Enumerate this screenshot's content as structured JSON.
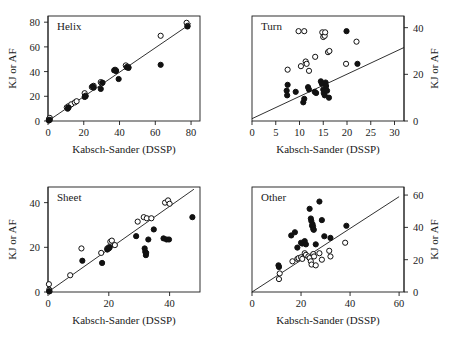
{
  "figure": {
    "background": "#ffffff",
    "marker_colors": {
      "open_circle_fill": "#ffffff",
      "open_circle_stroke": "#111111",
      "filled_circle": "#111111",
      "axis": "#1a1a1a",
      "fit_line": "#1a1a1a"
    }
  },
  "chart_data": [
    {
      "type": "scatter",
      "title": "Helix",
      "panel_index": 0,
      "xlabel": "Kabsch-Sander (DSSP)",
      "ylabel": "KJ or AF",
      "ylabel_side": "left",
      "xlim": [
        0,
        85
      ],
      "ylim": [
        0,
        85
      ],
      "xticks": [
        0,
        20,
        40,
        60,
        80
      ],
      "yticks": [
        0,
        20,
        40,
        60,
        80
      ],
      "grid": false,
      "legend": "none",
      "fit_line": {
        "x0": 0,
        "y0": 0,
        "x1": 80,
        "y1": 79
      },
      "series": [
        {
          "name": "open",
          "marker": "open-circle",
          "points": [
            [
              0.5,
              1.5
            ],
            [
              0.5,
              0.5
            ],
            [
              1.0,
              2.5
            ],
            [
              10.5,
              11.0
            ],
            [
              11.5,
              12.0
            ],
            [
              13.0,
              13.5
            ],
            [
              15.0,
              15.0
            ],
            [
              16.0,
              16.0
            ],
            [
              20.5,
              22.5
            ],
            [
              21.0,
              20.5
            ],
            [
              24.5,
              27.5
            ],
            [
              25.5,
              28.5
            ],
            [
              29.5,
              31.5
            ],
            [
              30.0,
              30.5
            ],
            [
              37.5,
              41.5
            ],
            [
              38.0,
              41.0
            ],
            [
              43.5,
              45.0
            ],
            [
              44.5,
              44.0
            ],
            [
              45.0,
              43.5
            ],
            [
              63.0,
              69.0
            ],
            [
              77.5,
              79.5
            ],
            [
              78.0,
              77.0
            ]
          ]
        },
        {
          "name": "filled",
          "marker": "filled-circle",
          "points": [
            [
              0.5,
              0.5
            ],
            [
              1.0,
              1.0
            ],
            [
              11.0,
              10.0
            ],
            [
              11.5,
              11.0
            ],
            [
              20.5,
              19.5
            ],
            [
              21.0,
              20.0
            ],
            [
              25.0,
              28.0
            ],
            [
              25.5,
              27.0
            ],
            [
              29.5,
              26.0
            ],
            [
              30.5,
              31.0
            ],
            [
              37.0,
              41.0
            ],
            [
              38.0,
              40.5
            ],
            [
              39.5,
              34.0
            ],
            [
              44.0,
              43.5
            ],
            [
              45.0,
              43.0
            ],
            [
              63.0,
              45.5
            ],
            [
              78.0,
              76.5
            ]
          ]
        }
      ]
    },
    {
      "type": "scatter",
      "title": "Turn",
      "panel_index": 1,
      "xlabel": "Kabsch-Sander (DSSP)",
      "ylabel": "KJ or AF",
      "ylabel_side": "right",
      "xlim": [
        0,
        32
      ],
      "ylim": [
        0,
        45
      ],
      "xticks": [
        0,
        5,
        10,
        15,
        20,
        25,
        30
      ],
      "yticks": [
        0,
        20,
        40
      ],
      "grid": false,
      "legend": "none",
      "fit_line": {
        "x0": 0,
        "y0": 1.0,
        "x1": 32,
        "y1": 31.5
      },
      "series": [
        {
          "name": "open",
          "marker": "open-circle",
          "points": [
            [
              7.5,
              22.0
            ],
            [
              9.8,
              38.5
            ],
            [
              10.3,
              23.5
            ],
            [
              11.0,
              38.5
            ],
            [
              11.3,
              25.5
            ],
            [
              11.5,
              24.5
            ],
            [
              12.0,
              21.5
            ],
            [
              13.3,
              27.5
            ],
            [
              14.8,
              38.0
            ],
            [
              15.0,
              36.0
            ],
            [
              15.3,
              36.5
            ],
            [
              15.4,
              38.0
            ],
            [
              16.0,
              29.5
            ],
            [
              16.3,
              30.0
            ],
            [
              19.8,
              24.5
            ],
            [
              22.0,
              34.0
            ]
          ]
        },
        {
          "name": "filled",
          "marker": "filled-circle",
          "points": [
            [
              7.3,
              13.0
            ],
            [
              7.4,
              11.0
            ],
            [
              7.5,
              15.5
            ],
            [
              9.2,
              12.5
            ],
            [
              10.8,
              8.0
            ],
            [
              11.0,
              9.5
            ],
            [
              11.8,
              14.5
            ],
            [
              12.0,
              13.5
            ],
            [
              13.2,
              12.5
            ],
            [
              13.5,
              12.0
            ],
            [
              14.5,
              17.0
            ],
            [
              14.7,
              16.0
            ],
            [
              15.0,
              13.5
            ],
            [
              15.1,
              12.0
            ],
            [
              15.3,
              11.0
            ],
            [
              15.5,
              16.5
            ],
            [
              15.6,
              15.0
            ],
            [
              15.8,
              13.0
            ],
            [
              16.2,
              10.0
            ],
            [
              19.9,
              38.5
            ],
            [
              22.2,
              24.5
            ]
          ]
        }
      ]
    },
    {
      "type": "scatter",
      "title": "Sheet",
      "panel_index": 2,
      "xlabel": "Kabsch-Sander (DSSP)",
      "ylabel": "KJ or AF",
      "ylabel_side": "left",
      "xlim": [
        0,
        50
      ],
      "ylim": [
        0,
        47
      ],
      "xticks": [
        0,
        20,
        40
      ],
      "yticks": [
        0,
        20,
        40
      ],
      "grid": false,
      "legend": "none",
      "fit_line": {
        "x0": 0,
        "y0": 0,
        "x1": 48,
        "y1": 46
      },
      "series": [
        {
          "name": "open",
          "marker": "open-circle",
          "points": [
            [
              0.3,
              3.5
            ],
            [
              0.4,
              1.0
            ],
            [
              0.5,
              0.3
            ],
            [
              7.3,
              7.5
            ],
            [
              11.0,
              19.5
            ],
            [
              17.5,
              17.5
            ],
            [
              19.5,
              19.5
            ],
            [
              20.0,
              20.0
            ],
            [
              20.5,
              22.5
            ],
            [
              21.0,
              23.0
            ],
            [
              22.0,
              21.0
            ],
            [
              29.5,
              31.5
            ],
            [
              31.5,
              33.5
            ],
            [
              32.5,
              33.0
            ],
            [
              34.0,
              33.0
            ],
            [
              38.5,
              40.0
            ],
            [
              39.5,
              41.0
            ],
            [
              40.0,
              39.5
            ]
          ]
        },
        {
          "name": "filled",
          "marker": "filled-circle",
          "points": [
            [
              0.4,
              0.3
            ],
            [
              11.3,
              14.0
            ],
            [
              17.8,
              13.0
            ],
            [
              19.5,
              19.0
            ],
            [
              20.0,
              19.5
            ],
            [
              20.3,
              20.0
            ],
            [
              29.0,
              25.0
            ],
            [
              31.8,
              19.5
            ],
            [
              32.0,
              18.0
            ],
            [
              32.2,
              16.5
            ],
            [
              32.3,
              17.5
            ],
            [
              33.0,
              23.5
            ],
            [
              34.8,
              28.0
            ],
            [
              38.0,
              24.0
            ],
            [
              39.0,
              23.5
            ],
            [
              39.8,
              23.5
            ],
            [
              47.5,
              33.5
            ]
          ]
        }
      ]
    },
    {
      "type": "scatter",
      "title": "Other",
      "panel_index": 3,
      "xlabel": "Kabsch-Sander (DSSP)",
      "ylabel": "KJ or AF",
      "ylabel_side": "right",
      "xlim": [
        0,
        62
      ],
      "ylim": [
        0,
        65
      ],
      "xticks": [
        0,
        20,
        40,
        60
      ],
      "yticks": [
        0,
        20,
        40,
        60
      ],
      "grid": false,
      "legend": "none",
      "fit_line": {
        "x0": 0,
        "y0": 0,
        "x1": 60,
        "y1": 59
      },
      "series": [
        {
          "name": "open",
          "marker": "open-circle",
          "points": [
            [
              11.0,
              8.0
            ],
            [
              11.3,
              11.5
            ],
            [
              16.5,
              19.0
            ],
            [
              18.5,
              20.5
            ],
            [
              19.0,
              21.0
            ],
            [
              20.0,
              21.5
            ],
            [
              20.5,
              20.5
            ],
            [
              21.5,
              24.0
            ],
            [
              22.0,
              23.0
            ],
            [
              23.0,
              22.0
            ],
            [
              23.5,
              21.0
            ],
            [
              24.0,
              19.0
            ],
            [
              24.3,
              17.0
            ],
            [
              25.0,
              23.5
            ],
            [
              25.3,
              22.0
            ],
            [
              26.0,
              16.5
            ],
            [
              27.5,
              24.0
            ],
            [
              28.5,
              20.0
            ],
            [
              31.5,
              25.5
            ],
            [
              32.0,
              22.0
            ],
            [
              38.0,
              30.5
            ]
          ]
        },
        {
          "name": "filled",
          "marker": "filled-circle",
          "points": [
            [
              10.8,
              16.5
            ],
            [
              11.0,
              15.5
            ],
            [
              16.0,
              35.0
            ],
            [
              17.5,
              37.0
            ],
            [
              18.5,
              27.5
            ],
            [
              20.0,
              30.5
            ],
            [
              20.5,
              30.0
            ],
            [
              21.5,
              31.5
            ],
            [
              22.0,
              29.5
            ],
            [
              23.5,
              51.5
            ],
            [
              24.0,
              45.5
            ],
            [
              24.2,
              44.0
            ],
            [
              24.5,
              41.0
            ],
            [
              24.7,
              42.0
            ],
            [
              24.9,
              40.5
            ],
            [
              25.0,
              39.0
            ],
            [
              25.2,
              38.5
            ],
            [
              26.0,
              29.5
            ],
            [
              27.5,
              56.0
            ],
            [
              28.5,
              44.5
            ],
            [
              29.5,
              34.5
            ],
            [
              32.0,
              33.5
            ],
            [
              38.5,
              41.0
            ]
          ]
        }
      ]
    }
  ]
}
